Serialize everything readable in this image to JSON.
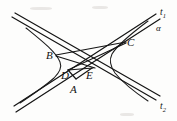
{
  "figure": {
    "kind": "geometry-diagram",
    "width": 177,
    "height": 121,
    "background_color": "#fdfdfc",
    "stroke_color": "#151515"
  },
  "points": [
    {
      "id": "A",
      "label": "A",
      "x": 73,
      "y": 80,
      "label_x": 69,
      "label_y": 83
    },
    {
      "id": "B",
      "label": "B",
      "x": 57,
      "y": 55,
      "label_x": 46,
      "label_y": 50
    },
    {
      "id": "C",
      "label": "C",
      "x": 124,
      "y": 44,
      "label_x": 127,
      "label_y": 38
    },
    {
      "id": "D",
      "label": "D",
      "x": 70,
      "y": 69,
      "label_x": 63,
      "label_y": 69
    },
    {
      "id": "E",
      "label": "E",
      "x": 91,
      "y": 69,
      "label_x": 87,
      "label_y": 69
    }
  ],
  "axis_lines": [
    {
      "id": "t1",
      "label": "t",
      "subscript": "1",
      "label_x": 159,
      "label_y": 9
    },
    {
      "id": "t2",
      "label": "t",
      "subscript": "2",
      "label_x": 159,
      "label_y": 104
    }
  ],
  "angles": [
    {
      "id": "alpha",
      "label": "α",
      "label_x": 156,
      "label_y": 25
    }
  ],
  "segments": [
    {
      "from": "B",
      "to": "C"
    },
    {
      "from": "B",
      "to": "E"
    },
    {
      "from": "D",
      "to": "C"
    },
    {
      "from": "D",
      "to": "E"
    },
    {
      "from": "A",
      "to": "D"
    },
    {
      "from": "A",
      "to": "E"
    }
  ],
  "curves": [
    {
      "id": "left-branch",
      "description": "left branch of hyperbola opening left, through B and D"
    },
    {
      "id": "right-branch",
      "description": "right branch of hyperbola opening right, through C and E"
    }
  ]
}
